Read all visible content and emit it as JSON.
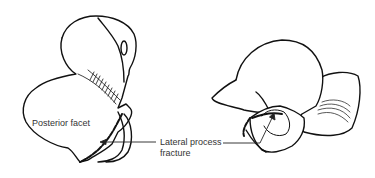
{
  "figure": {
    "type": "anatomical line drawing",
    "labels": {
      "posterior_facet": "Posterior facet",
      "fracture_line1": "Lateral process",
      "fracture_line2": "fracture"
    },
    "colors": {
      "line": "#111111",
      "background": "#ffffff",
      "text": "#333333"
    }
  }
}
